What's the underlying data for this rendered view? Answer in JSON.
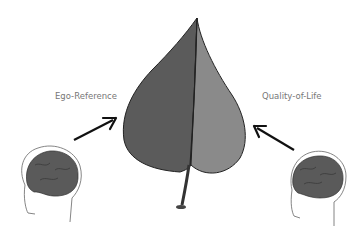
{
  "diagram": {
    "labels": {
      "left": "Ego-Reference",
      "right": "Quality-of-Life"
    },
    "nodes": [
      {
        "id": "left-head",
        "icon": "brain-head-icon",
        "facing": "left"
      },
      {
        "id": "leaf",
        "icon": "leaf-icon",
        "halves": [
          "dark",
          "light"
        ]
      },
      {
        "id": "right-head",
        "icon": "brain-head-icon",
        "facing": "right"
      }
    ],
    "edges": [
      {
        "from": "left-head",
        "to": "leaf",
        "label": "Ego-Reference"
      },
      {
        "from": "right-head",
        "to": "leaf",
        "label": "Quality-of-Life"
      }
    ],
    "colors": {
      "leaf_dark": "#5b5b5b",
      "leaf_light": "#8a8a8a",
      "brain": "#5a5a5a",
      "arrow": "#111111",
      "label_text": "#777777"
    }
  }
}
